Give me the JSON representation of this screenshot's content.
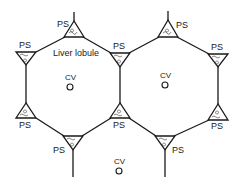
{
  "diagram": {
    "title_label": "Liver lobule",
    "portal_space_label": "PS",
    "central_vein_label": "CV",
    "colors": {
      "line": "#1a1a1a",
      "background": "#ffffff"
    },
    "portal_spaces": [
      {
        "id": "ps-top-left",
        "label": "PS",
        "orientation": "up",
        "cx": 74,
        "cy": 30
      },
      {
        "id": "ps-top-right",
        "label": "PS",
        "orientation": "up",
        "cx": 168,
        "cy": 29
      },
      {
        "id": "ps-left-upper",
        "label": "PS",
        "orientation": "down",
        "cx": 26,
        "cy": 57
      },
      {
        "id": "ps-middle-upper",
        "label": "PS",
        "orientation": "down",
        "cx": 120,
        "cy": 58
      },
      {
        "id": "ps-right-upper",
        "label": "PS",
        "orientation": "down",
        "cx": 218,
        "cy": 59
      },
      {
        "id": "ps-left-lower",
        "label": "PS",
        "orientation": "up",
        "cx": 26,
        "cy": 112
      },
      {
        "id": "ps-middle-lower",
        "label": "PS",
        "orientation": "up",
        "cx": 120,
        "cy": 112
      },
      {
        "id": "ps-right-lower",
        "label": "PS",
        "orientation": "up",
        "cx": 218,
        "cy": 113
      },
      {
        "id": "ps-bottom-left",
        "label": "PS",
        "orientation": "down",
        "cx": 73,
        "cy": 141
      },
      {
        "id": "ps-bottom-right",
        "label": "PS",
        "orientation": "down",
        "cx": 165,
        "cy": 141
      }
    ],
    "central_veins": [
      {
        "id": "cv-left-lobule",
        "label": "CV",
        "x": 70,
        "y": 87
      },
      {
        "id": "cv-right-lobule",
        "label": "CV",
        "x": 165,
        "y": 85
      },
      {
        "id": "cv-bottom-lobule",
        "label": "CV",
        "x": 119,
        "y": 171
      }
    ]
  }
}
